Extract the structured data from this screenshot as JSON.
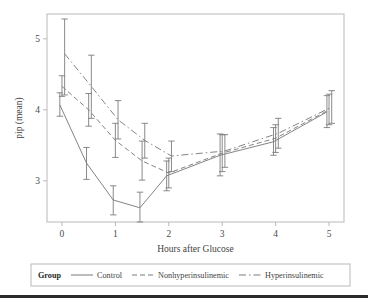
{
  "chart_data": {
    "type": "line",
    "title": "",
    "xlabel": "Hours after Glucose",
    "ylabel": "pip (mean)",
    "xlim": [
      -0.28,
      5.28
    ],
    "ylim": [
      2.42,
      5.35
    ],
    "xticks": [
      0,
      1,
      2,
      3,
      4,
      5
    ],
    "xticklabels": [
      "0",
      "1",
      "2",
      "3",
      "4",
      "5"
    ],
    "yticks": [
      3,
      4,
      5
    ],
    "yticklabels": [
      "3",
      "4",
      "5"
    ],
    "grid": false,
    "legend_position": "below",
    "legend_title": "Group",
    "error_bars": "vertical",
    "x": [
      0,
      0.5,
      1,
      1.5,
      2,
      3,
      4,
      5
    ],
    "series": [
      {
        "name": "Control",
        "linestyle": "solid",
        "color": "#7d7d7d",
        "x_offset": -0.04,
        "values": [
          4.07,
          3.25,
          2.73,
          2.62,
          3.07,
          3.36,
          3.55,
          3.97
        ],
        "err_low": [
          3.91,
          3.02,
          2.52,
          2.42,
          2.86,
          3.07,
          3.36,
          3.75
        ],
        "err_high": [
          4.24,
          3.47,
          2.93,
          2.84,
          3.28,
          3.66,
          3.75,
          4.2
        ]
      },
      {
        "name": "Nonhyperinsulinemic",
        "linestyle": "dashed",
        "color": "#7d7d7d",
        "x_offset": 0.0,
        "values": [
          4.33,
          4.0,
          3.57,
          3.28,
          3.11,
          3.39,
          3.6,
          4.0
        ],
        "err_low": [
          4.19,
          3.77,
          3.33,
          3.01,
          2.9,
          3.13,
          3.4,
          3.79
        ],
        "err_high": [
          4.48,
          4.23,
          3.81,
          3.56,
          3.32,
          3.65,
          3.79,
          4.22
        ]
      },
      {
        "name": "Hyperinsulinemic",
        "linestyle": "dashdot",
        "color": "#7d7d7d",
        "x_offset": 0.05,
        "values": [
          4.79,
          4.33,
          3.86,
          3.57,
          3.35,
          3.42,
          3.67,
          4.04
        ],
        "err_low": [
          4.21,
          3.88,
          3.59,
          3.32,
          3.13,
          3.19,
          3.46,
          3.81
        ],
        "err_high": [
          5.28,
          4.77,
          4.13,
          3.81,
          3.56,
          3.65,
          3.88,
          4.27
        ]
      }
    ]
  },
  "axes": {
    "x_title": "Hours after Glucose",
    "y_title": "pip (mean)"
  },
  "legend": {
    "title": "Group",
    "items": [
      {
        "label": "Control",
        "style": "solid"
      },
      {
        "label": "Nonhyperinsulinemic",
        "style": "dashed"
      },
      {
        "label": "Hyperinsulinemic",
        "style": "dashdot"
      }
    ]
  },
  "colors": {
    "line": "#7d7d7d",
    "frame": "#b9b9b9",
    "text": "#3f3f3f",
    "rule": "#2b2b2b"
  }
}
